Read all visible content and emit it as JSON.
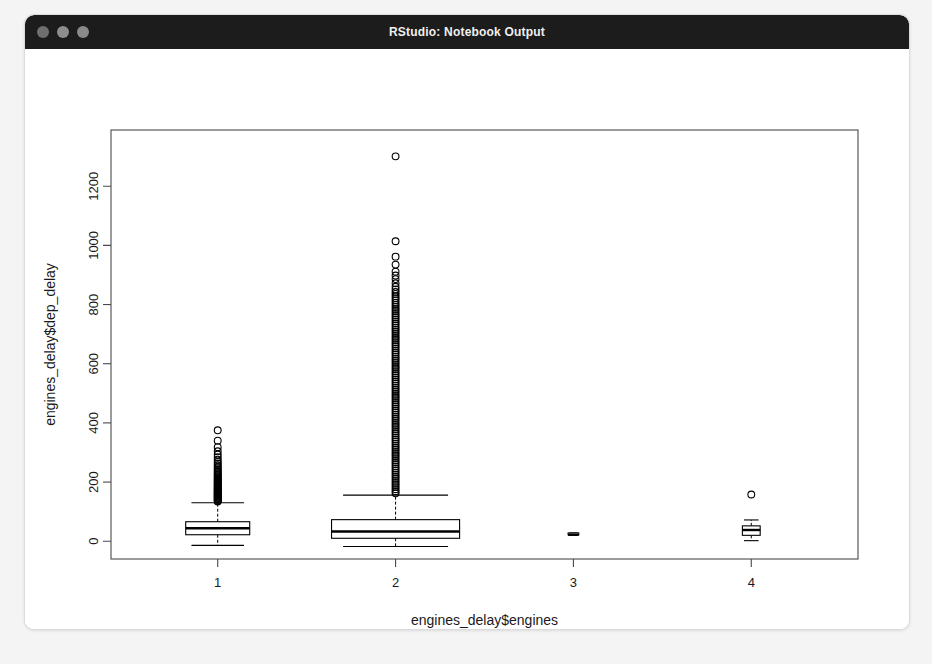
{
  "window": {
    "title": "RStudio: Notebook Output",
    "controls": [
      {
        "name": "close",
        "color": "#6f6f6f"
      },
      {
        "name": "minimize",
        "color": "#8e8e8e"
      },
      {
        "name": "zoom",
        "color": "#8a8a8a"
      }
    ]
  },
  "chart_data": {
    "type": "boxplot",
    "title": "",
    "xlabel": "engines_delay$engines",
    "ylabel": "engines_delay$dep_delay",
    "x_categories": [
      "1",
      "2",
      "3",
      "4"
    ],
    "x_tick_labels": [
      "1",
      "2",
      "3",
      "4"
    ],
    "y_tick_labels": [
      "0",
      "200",
      "400",
      "600",
      "800",
      "1000",
      "1200"
    ],
    "y_ticks": [
      0,
      200,
      400,
      600,
      800,
      1000,
      1200
    ],
    "ylim": [
      -60,
      1390
    ],
    "xlim": [
      0.4,
      4.6
    ],
    "grid": false,
    "legend": null,
    "frame": true,
    "box_color": "#000000",
    "fill_color": "#ffffff",
    "series": [
      {
        "name": "1 engine",
        "category": "1",
        "box_width": 0.36,
        "lower_whisker": -14,
        "q1": 22,
        "median": 44,
        "q3": 66,
        "upper_whisker": 130,
        "outliers": [
          134,
          136,
          139,
          141,
          143,
          146,
          148,
          150,
          152,
          155,
          157,
          159,
          162,
          164,
          166,
          168,
          171,
          173,
          176,
          178,
          181,
          183,
          186,
          188,
          191,
          194,
          197,
          200,
          203,
          206,
          209,
          212,
          216,
          219,
          223,
          226,
          230,
          234,
          238,
          242,
          247,
          252,
          257,
          263,
          269,
          276,
          284,
          293,
          304,
          318,
          340,
          375
        ]
      },
      {
        "name": "2 engines",
        "category": "2",
        "box_width": 0.72,
        "lower_whisker": -18,
        "q1": 10,
        "median": 33,
        "q3": 73,
        "upper_whisker": 156,
        "outliers": [
          1301,
          1014,
          962,
          935,
          911,
          898,
          886,
          872,
          860,
          851,
          843,
          836,
          828,
          821,
          814,
          806,
          799,
          792,
          785,
          778,
          771,
          764,
          757,
          750,
          743,
          736,
          729,
          722,
          715,
          708,
          701,
          694,
          687,
          680,
          673,
          666,
          659,
          652,
          645,
          638,
          631,
          624,
          617,
          610,
          603,
          596,
          589,
          582,
          575,
          568,
          561,
          554,
          547,
          540,
          533,
          526,
          519,
          512,
          505,
          498,
          491,
          484,
          477,
          470,
          463,
          456,
          449,
          442,
          435,
          428,
          421,
          414,
          407,
          400,
          393,
          386,
          379,
          372,
          365,
          358,
          351,
          344,
          337,
          330,
          323,
          316,
          309,
          302,
          295,
          288,
          281,
          274,
          267,
          260,
          253,
          246,
          239,
          232,
          225,
          218,
          211,
          204,
          197,
          190,
          183,
          176,
          169,
          162
        ]
      },
      {
        "name": "3 engines",
        "category": "3",
        "box_width": 0.06,
        "lower_whisker": 22,
        "q1": 22,
        "median": 22,
        "q3": 28,
        "upper_whisker": 28,
        "outliers": []
      },
      {
        "name": "4 engines",
        "category": "4",
        "box_width": 0.1,
        "lower_whisker": 2,
        "q1": 20,
        "median": 38,
        "q3": 52,
        "upper_whisker": 72,
        "outliers": [
          158
        ]
      }
    ]
  }
}
